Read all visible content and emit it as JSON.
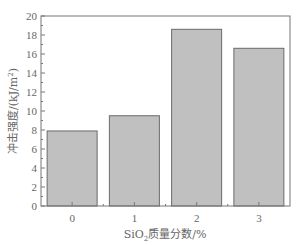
{
  "chart_data": {
    "type": "bar",
    "title": "",
    "xlabel": "SiO₂质量分数/%",
    "ylabel": "冲击强度/(kJ/m²)",
    "categories": [
      "0",
      "1",
      "2",
      "3"
    ],
    "values": [
      7.9,
      9.5,
      18.6,
      16.6
    ],
    "ylim": [
      0,
      20
    ],
    "yticks": [
      0,
      2,
      4,
      6,
      8,
      10,
      12,
      14,
      16,
      18,
      20
    ],
    "grid": false,
    "legend": null,
    "bar_color": "#c0c0c0",
    "bar_edge_color": "#6a6a6a",
    "axis_color": "#777777"
  }
}
